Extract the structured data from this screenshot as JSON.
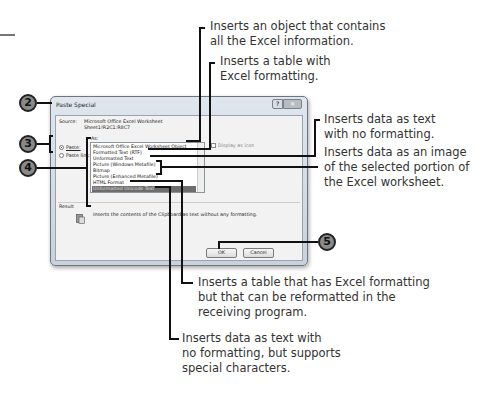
{
  "dialog": {
    "title": "Paste Special",
    "help_button": "?",
    "close_button": "✕",
    "source_label": "Source:",
    "source_value_line1": "Microsoft Office Excel Worksheet",
    "source_value_line2": "Sheet1!R2C1:R8C7",
    "as_label": "As:",
    "radio_paste": "Paste:",
    "radio_paste_link": "Paste link:",
    "list_items": [
      "Microsoft Office Excel Worksheet Object",
      "Formatted Text (RTF)",
      "Unformatted Text",
      "Picture (Windows Metafile)",
      "Bitmap",
      "Picture (Enhanced Metafile)",
      "HTML Format",
      "Unformatted Unicode Text"
    ],
    "selected_item": "Unformatted Unicode Text",
    "display_as_icon": "Display as icon",
    "result_label": "Result",
    "result_text": "Inserts the contents of the Clipboard as text without any formatting.",
    "ok_button": "OK",
    "cancel_button": "Cancel"
  },
  "steps": {
    "two": "2",
    "three": "3",
    "four": "4",
    "five": "5"
  },
  "callouts": {
    "excel_object": "Inserts an object that contains\nall the Excel information.",
    "rtf": "Inserts a table with\nExcel formatting.",
    "unformatted": "Inserts data as text\nwith no formatting.",
    "picture": "Inserts data as an image\nof the selected portion of\nthe Excel worksheet.",
    "html": "Inserts a table that has Excel formatting\nbut that can be reformatted in the\nreceiving program.",
    "unicode": "Inserts data as text with\nno formatting, but supports\nspecial characters."
  }
}
